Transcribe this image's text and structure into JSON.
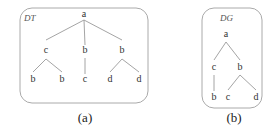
{
  "panels": [
    {
      "id": "a",
      "title": "DT",
      "caption": "(a)",
      "box": {
        "x": 20,
        "y": 8,
        "w": 128,
        "h": 95,
        "r": 12
      },
      "title_pos": {
        "x": 24,
        "y": 21
      },
      "caption_pos": {
        "x": 85,
        "y": 122
      },
      "nodes": [
        {
          "id": "a1",
          "label": "a",
          "x": 84,
          "y": 17
        },
        {
          "id": "c1",
          "label": "c",
          "x": 46,
          "y": 53
        },
        {
          "id": "b1",
          "label": "b",
          "x": 85,
          "y": 53
        },
        {
          "id": "b2",
          "label": "b",
          "x": 122,
          "y": 53
        },
        {
          "id": "b3",
          "label": "b",
          "x": 33,
          "y": 82
        },
        {
          "id": "b4",
          "label": "b",
          "x": 62,
          "y": 82
        },
        {
          "id": "c2",
          "label": "c",
          "x": 85,
          "y": 82
        },
        {
          "id": "d1",
          "label": "d",
          "x": 110,
          "y": 82
        },
        {
          "id": "d2",
          "label": "d",
          "x": 139,
          "y": 82
        }
      ],
      "edges": [
        {
          "x1": 84,
          "y1": 20,
          "x2": 46,
          "y2": 40
        },
        {
          "x1": 84,
          "y1": 20,
          "x2": 85,
          "y2": 45
        },
        {
          "x1": 84,
          "y1": 20,
          "x2": 122,
          "y2": 40
        },
        {
          "x1": 46,
          "y1": 59,
          "x2": 33,
          "y2": 72
        },
        {
          "x1": 46,
          "y1": 59,
          "x2": 62,
          "y2": 72
        },
        {
          "x1": 85,
          "y1": 58,
          "x2": 85,
          "y2": 74
        },
        {
          "x1": 122,
          "y1": 59,
          "x2": 110,
          "y2": 72
        },
        {
          "x1": 122,
          "y1": 59,
          "x2": 139,
          "y2": 72
        }
      ]
    },
    {
      "id": "b",
      "title": "DG",
      "caption": "(b)",
      "box": {
        "x": 202,
        "y": 8,
        "w": 60,
        "h": 100,
        "r": 12
      },
      "title_pos": {
        "x": 220,
        "y": 21
      },
      "caption_pos": {
        "x": 234,
        "y": 122
      },
      "nodes": [
        {
          "id": "a1",
          "label": "a",
          "x": 226,
          "y": 37
        },
        {
          "id": "c1",
          "label": "c",
          "x": 214,
          "y": 70
        },
        {
          "id": "b1",
          "label": "b",
          "x": 240,
          "y": 70
        },
        {
          "id": "b2",
          "label": "b",
          "x": 214,
          "y": 100
        },
        {
          "id": "c2",
          "label": "c",
          "x": 228,
          "y": 100
        },
        {
          "id": "d1",
          "label": "d",
          "x": 256,
          "y": 100
        }
      ],
      "edges": [
        {
          "x1": 226,
          "y1": 42,
          "x2": 214,
          "y2": 60
        },
        {
          "x1": 226,
          "y1": 42,
          "x2": 240,
          "y2": 60
        },
        {
          "x1": 214,
          "y1": 75,
          "x2": 214,
          "y2": 91
        },
        {
          "x1": 240,
          "y1": 75,
          "x2": 228,
          "y2": 90
        },
        {
          "x1": 240,
          "y1": 75,
          "x2": 256,
          "y2": 90
        }
      ]
    }
  ]
}
